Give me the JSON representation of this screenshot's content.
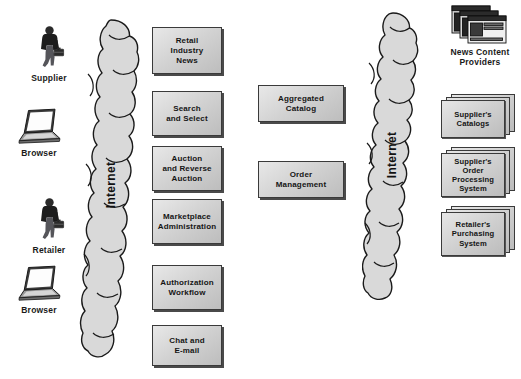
{
  "diagram": {
    "background_color": "#ffffff",
    "box_fill_color": "#d4d4d4",
    "box_border_color": "#3a3a3a",
    "cloud_fill_color": "#d9d9d9"
  },
  "left_actors": [
    {
      "id": "supplier",
      "label": "Supplier",
      "icon": "person-with-briefcase-icon"
    },
    {
      "id": "browser-top",
      "label": "Browser",
      "icon": "laptop-icon"
    },
    {
      "id": "retailer",
      "label": "Retailer",
      "icon": "person-with-briefcase-icon"
    },
    {
      "id": "browser-bottom",
      "label": "Browser",
      "icon": "laptop-icon"
    }
  ],
  "clouds": [
    {
      "id": "left-internet-cloud",
      "label": "Internet"
    },
    {
      "id": "right-internet-cloud",
      "label": "Internet"
    }
  ],
  "service_boxes": [
    {
      "id": "retail-industry-news",
      "label": "Retail\nIndustry\nNews"
    },
    {
      "id": "search-and-select",
      "label": "Search\nand Select"
    },
    {
      "id": "auction-and-reverse-auction",
      "label": "Auction\nand Reverse\nAuction"
    },
    {
      "id": "marketplace-administration",
      "label": "Marketplace\nAdministration"
    },
    {
      "id": "authorization-workflow",
      "label": "Authorization\nWorkflow"
    },
    {
      "id": "chat-and-email",
      "label": "Chat and\nE-mail"
    }
  ],
  "core_boxes": [
    {
      "id": "aggregated-catalog",
      "label": "Aggregated\nCatalog"
    },
    {
      "id": "order-management",
      "label": "Order\nManagement"
    }
  ],
  "right_nodes": [
    {
      "id": "news-content-providers",
      "label": "News Content\nProviders",
      "icon": "stacked-browser-windows-icon"
    },
    {
      "id": "suppliers-catalogs",
      "label": "Supplier's\nCatalogs",
      "icon": "stacked-document-boxes-icon"
    },
    {
      "id": "suppliers-order-processing-system",
      "label": "Supplier's\nOrder\nProcessing\nSystem",
      "icon": "stacked-document-boxes-icon"
    },
    {
      "id": "retailers-purchasing-system",
      "label": "Retailer's\nPurchasing\nSystem",
      "icon": "stacked-document-boxes-icon"
    }
  ]
}
